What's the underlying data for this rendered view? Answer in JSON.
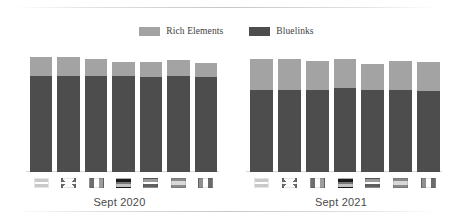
{
  "legend": {
    "items": [
      {
        "label": "Rich Elements",
        "color": "#a3a3a3",
        "icon": "legend-swatch"
      },
      {
        "label": "Bluelinks",
        "color": "#4d4d4d",
        "icon": "legend-swatch"
      }
    ]
  },
  "groups": [
    {
      "caption": "Sept 2020"
    },
    {
      "caption": "Sept 2021"
    }
  ],
  "axis": {
    "ticks_2020": [
      "100",
      "80",
      "60",
      "40",
      "20",
      "0"
    ],
    "ticks_2021": [
      "120",
      "100",
      "80",
      "60",
      "40",
      "20",
      "0"
    ]
  },
  "chart_data": {
    "type": "bar",
    "title": "",
    "subtitle": "",
    "xlabel": "",
    "ylabel": "",
    "stacked": true,
    "grid": false,
    "legend_position": "top-center",
    "groups": [
      "Sept 2020",
      "Sept 2021"
    ],
    "categories": [
      "United States",
      "United Kingdom",
      "France",
      "Germany",
      "Netherlands",
      "Spain",
      "Italy"
    ],
    "category_icons": [
      "flag-us",
      "flag-uk",
      "flag-france",
      "flag-germany",
      "flag-netherlands",
      "flag-spain",
      "flag-italy"
    ],
    "panels": [
      {
        "group": "Sept 2020",
        "ylim": [
          0,
          100
        ],
        "yticks": [
          0,
          20,
          40,
          60,
          80,
          100
        ],
        "series": [
          {
            "name": "Bluelinks",
            "color": "#4d4d4d",
            "values": [
              80,
              80,
              80,
              80,
              79,
              80,
              79
            ]
          },
          {
            "name": "Rich Elements",
            "color": "#a3a3a3",
            "values": [
              16,
              16,
              14,
              12,
              13,
              13,
              12
            ]
          }
        ],
        "totals": [
          96,
          96,
          94,
          92,
          92,
          93,
          91
        ]
      },
      {
        "group": "Sept 2021",
        "ylim": [
          0,
          120
        ],
        "yticks": [
          0,
          20,
          40,
          60,
          80,
          100,
          120
        ],
        "series": [
          {
            "name": "Bluelinks",
            "color": "#4d4d4d",
            "values": [
              75,
              75,
              75,
              76,
              75,
              75,
              74
            ]
          },
          {
            "name": "Rich Elements",
            "color": "#a3a3a3",
            "values": [
              28,
              28,
              26,
              27,
              23,
              26,
              26
            ]
          }
        ],
        "totals": [
          103,
          103,
          101,
          103,
          98,
          101,
          100
        ]
      }
    ]
  }
}
